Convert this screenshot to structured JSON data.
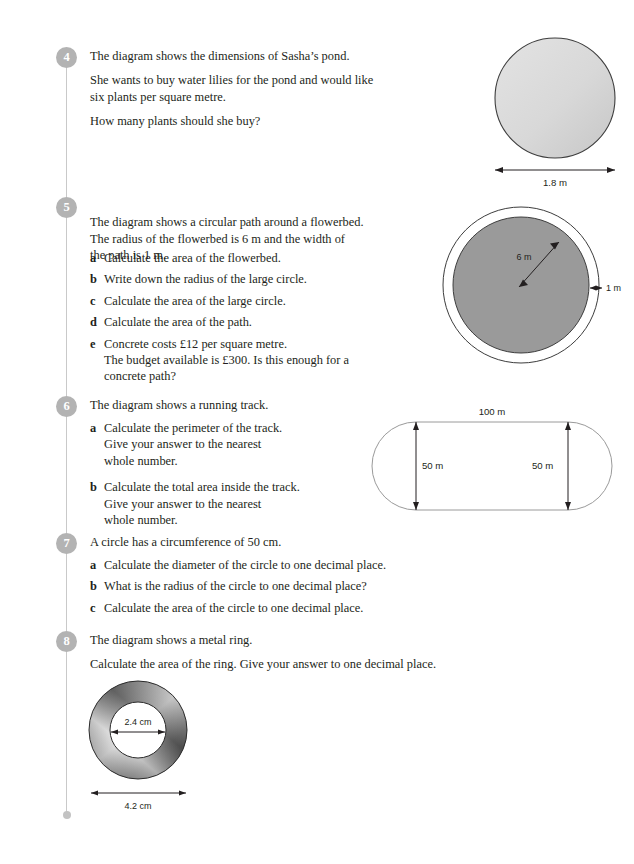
{
  "page": {
    "background": "#ffffff",
    "spine_color": "#c9c9c9",
    "badge_color": "#b3b3b3",
    "text_color": "#231f20"
  },
  "questions": [
    {
      "number": "4",
      "lines": [
        "The diagram shows the dimensions of Sasha’s pond.",
        "She wants to buy water lilies for the pond and would like\nsix plants per square metre.",
        "How many plants should she buy?"
      ],
      "parts": []
    },
    {
      "number": "5",
      "lines": [
        "The diagram shows a circular path around a flowerbed.\nThe radius of the flowerbed is 6 m and the width of\nthe path is 1 m."
      ],
      "parts": [
        {
          "label": "a",
          "text": "Calculate the area of the flowerbed.",
          "sub": ""
        },
        {
          "label": "b",
          "text": "Write down the radius of the large circle.",
          "sub": ""
        },
        {
          "label": "c",
          "text": "Calculate the area of the large circle.",
          "sub": ""
        },
        {
          "label": "d",
          "text": "Calculate the area of the path.",
          "sub": ""
        },
        {
          "label": "e",
          "text": "Concrete costs £12 per square metre.",
          "sub": "The budget available is £300. Is this enough for a\nconcrete path?"
        }
      ]
    },
    {
      "number": "6",
      "lines": [
        "The diagram shows a running track."
      ],
      "parts": [
        {
          "label": "a",
          "text": "Calculate the perimeter of the track.",
          "sub": "Give your answer to the nearest\nwhole number."
        },
        {
          "label": "b",
          "text": "Calculate the total area inside the track.",
          "sub": "Give your answer to the nearest\nwhole number."
        }
      ]
    },
    {
      "number": "7",
      "lines": [
        "A circle has a circumference of 50 cm."
      ],
      "parts": [
        {
          "label": "a",
          "text": "Calculate the diameter of the circle to one decimal place.",
          "sub": ""
        },
        {
          "label": "b",
          "text": "What is the radius of the circle to one decimal place?",
          "sub": ""
        },
        {
          "label": "c",
          "text": "Calculate the area of the circle to one decimal place.",
          "sub": ""
        }
      ]
    },
    {
      "number": "8",
      "lines": [
        "The diagram shows a metal ring.",
        "Calculate the area of the ring. Give your answer to one decimal place."
      ],
      "parts": []
    }
  ],
  "figures": {
    "pond": {
      "name": "circular pond",
      "fill": "#d9d9d9",
      "stroke": "#3d3d3d",
      "dimension_label": "1.8 m"
    },
    "flowerbed": {
      "name": "circular path around flowerbed",
      "inner_fill": "#9a9a9a",
      "outer_fill": "#ffffff",
      "stroke": "#3d3d3d",
      "radius_label": "6 m",
      "path_width_label": "1 m"
    },
    "track": {
      "name": "running track",
      "fill": "#ffffff",
      "stroke": "#9a9a9a",
      "length_label": "100 m",
      "width_label_left": "50 m",
      "width_label_right": "50 m"
    },
    "ring": {
      "name": "metal ring",
      "inner_diameter_label": "2.4 cm",
      "outer_diameter_label": "4.2 cm",
      "metal_dark": "#3b3b3b",
      "metal_light": "#e6e6e6"
    }
  }
}
